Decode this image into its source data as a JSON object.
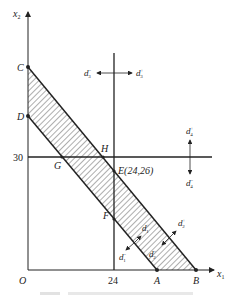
{
  "axes": {
    "x_label": "x",
    "x_sub": "1",
    "y_label": "x",
    "y_sub": "2",
    "origin": "O",
    "x_tick": "24",
    "y_tick": "30"
  },
  "points": {
    "C": "C",
    "D": "D",
    "A": "A",
    "B": "B",
    "G": "G",
    "H": "H",
    "E": "E(24,26)",
    "F": "F"
  },
  "deviations": {
    "d1_minus": {
      "base": "d",
      "sub": "1",
      "sup": "−"
    },
    "d1_plus": {
      "base": "d",
      "sub": "1",
      "sup": "+"
    },
    "d2_minus": {
      "base": "d",
      "sub": "2",
      "sup": "−"
    },
    "d2_plus": {
      "base": "d",
      "sub": "2",
      "sup": "+"
    },
    "d3_minus": {
      "base": "d",
      "sub": "3",
      "sup": "−"
    },
    "d3_plus": {
      "base": "d",
      "sub": "3",
      "sup": "+"
    },
    "d4_minus": {
      "base": "d",
      "sub": "4",
      "sup": "−"
    },
    "d4_plus": {
      "base": "d",
      "sub": "4",
      "sup": "+"
    }
  },
  "colors": {
    "ink": "#222222",
    "caption": "#dddddd"
  }
}
